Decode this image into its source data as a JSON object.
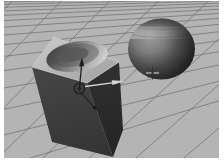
{
  "scene": {
    "view": "perspective-viewport",
    "objects": [
      {
        "name": "boolean-box",
        "selected": true
      },
      {
        "name": "sphere",
        "selected": false
      }
    ]
  },
  "canvas": {
    "bg": "#ffffff"
  },
  "viewport": {
    "bg": "#b4b4b4",
    "grid_line": "#6f6f6f"
  },
  "cube": {
    "top_back": "#c6c6c6",
    "top_front": "#9b9b9b",
    "front_top": "#454545",
    "front_bottom": "#343434",
    "right_top": "#303030",
    "right_bottom": "#252525",
    "crater_dark": "#474747",
    "crater_light": "#d2d2d2",
    "crater_floor_dark": "#4c4c4c",
    "crater_floor_light": "#8f8f8f",
    "crater_pit": "#565656",
    "edge_highlight": "#d4d4d4"
  },
  "sphere": {
    "highlight": "#9c9c9c",
    "upper": "#7e7e7e",
    "mid": "#4f4f4f",
    "lower": "#2c2c2c",
    "dark": "#171717",
    "cap": "#3f3f3f",
    "band": "#d0d0d0",
    "lat_line": "#2e2e2e"
  },
  "gizmo": {
    "dark_axis": "#1c1c1c",
    "light_axis": "#d6d6d6",
    "ring": "#1c1c1c"
  },
  "pivot": {
    "dark": "#2f2f2f",
    "light": "#e2e2e2"
  }
}
